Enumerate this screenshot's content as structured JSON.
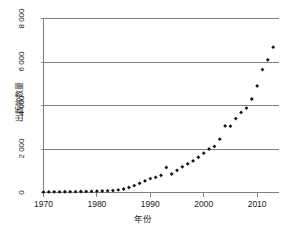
{
  "chart_data": {
    "type": "scatter",
    "title": "",
    "xlabel": "年份",
    "ylabel": "出版物数量",
    "xlim": [
      1970,
      2014
    ],
    "ylim": [
      0,
      8000
    ],
    "grid": true,
    "grid_axis": "y",
    "legend": "none",
    "marker": "diamond",
    "marker_color": "#111111",
    "axis_color": "#808080",
    "grid_color": "#808080",
    "xticks": [
      1970,
      1980,
      1990,
      2000,
      2010
    ],
    "xtick_labels": [
      "1970",
      "1980",
      "1990",
      "2000",
      "2010"
    ],
    "yticks": [
      0,
      2000,
      4000,
      6000,
      8000
    ],
    "ytick_labels": [
      "0",
      "2 000",
      "4 000",
      "6 000",
      "8 000"
    ],
    "x": [
      1970,
      1971,
      1972,
      1973,
      1974,
      1975,
      1976,
      1977,
      1978,
      1979,
      1980,
      1981,
      1982,
      1983,
      1984,
      1985,
      1986,
      1987,
      1988,
      1989,
      1990,
      1991,
      1992,
      1993,
      1994,
      1995,
      1996,
      1997,
      1998,
      1999,
      2000,
      2001,
      2002,
      2003,
      2004,
      2005,
      2006,
      2007,
      2008,
      2009,
      2010,
      2011,
      2012,
      2013
    ],
    "values": [
      20,
      25,
      30,
      30,
      35,
      40,
      40,
      45,
      50,
      55,
      60,
      70,
      75,
      90,
      120,
      160,
      230,
      320,
      420,
      530,
      640,
      700,
      790,
      1150,
      850,
      1020,
      1180,
      1320,
      1450,
      1620,
      1810,
      2000,
      2120,
      2450,
      3060,
      3050,
      3400,
      3680,
      3880,
      4300,
      4900,
      5650,
      6100,
      6680
    ]
  }
}
